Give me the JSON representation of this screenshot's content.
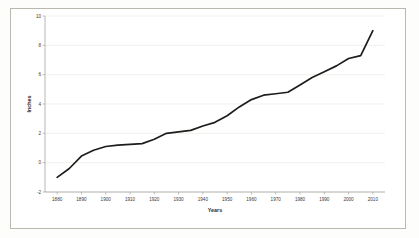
{
  "figure": {
    "background_color": "#fdfdfb",
    "plot_background_color": "#ffffff",
    "frame_color": "#b9b7ae"
  },
  "chart_data": {
    "type": "line",
    "title": "",
    "subtitle": "",
    "xlabel": "Years",
    "ylabel": "Inches",
    "xlim": [
      1875,
      2015
    ],
    "ylim": [
      -2,
      10
    ],
    "grid": true,
    "grid_axis": "y",
    "legend": false,
    "legend_position": "none",
    "line_color": "#1d1d1b",
    "x_tick_labels": [
      "1880",
      "1890",
      "1900",
      "1910",
      "1920",
      "1930",
      "1940",
      "1950",
      "1960",
      "1970",
      "1980",
      "1990",
      "2000",
      "2010"
    ],
    "y_tick_labels": [
      "-2",
      "0",
      "2",
      "4",
      "6",
      "8",
      "10"
    ],
    "x_ticks": [
      1880,
      1890,
      1900,
      1910,
      1920,
      1930,
      1940,
      1950,
      1960,
      1970,
      1980,
      1990,
      2000,
      2010
    ],
    "y_ticks": [
      -2,
      0,
      2,
      4,
      6,
      8,
      10
    ],
    "series": [
      {
        "name": "Sea level rise",
        "x": [
          1880,
          1885,
          1890,
          1895,
          1900,
          1905,
          1910,
          1915,
          1920,
          1925,
          1930,
          1935,
          1940,
          1945,
          1950,
          1955,
          1960,
          1965,
          1970,
          1975,
          1980,
          1985,
          1990,
          1995,
          2000,
          2005,
          2010
        ],
        "values": [
          -1.0,
          -0.4,
          0.45,
          0.85,
          1.1,
          1.2,
          1.25,
          1.3,
          1.6,
          2.0,
          2.1,
          2.2,
          2.5,
          2.75,
          3.2,
          3.8,
          4.3,
          4.6,
          4.7,
          4.8,
          5.3,
          5.8,
          6.2,
          6.6,
          7.1,
          7.3,
          9.0
        ]
      }
    ]
  }
}
